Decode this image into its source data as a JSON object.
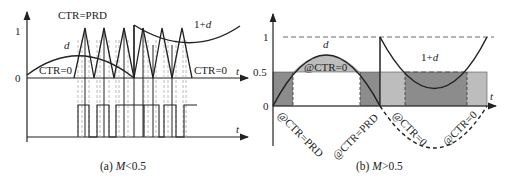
{
  "panel_a": {
    "caption_prefix": "(a) ",
    "caption_var": "M",
    "caption_suffix": "<0.5",
    "y_tick_1": "1",
    "y_tick_0": "0",
    "label_ctr_prd": "CTR=PRD",
    "label_ctr0_left": "CTR=0",
    "label_ctr0_right": "CTR=0",
    "label_d": "d",
    "label_1pd_num": "1+",
    "label_1pd_var": "d",
    "x_label_top": "t",
    "x_label_bottom": "t"
  },
  "panel_b": {
    "caption_prefix": "(b) ",
    "caption_var": "M",
    "caption_suffix": ">0.5",
    "y_tick_1": "1",
    "y_tick_05": "0.5",
    "y_tick_0": "0",
    "label_d": "d",
    "label_1pd_num": "1+",
    "label_1pd_var": "d",
    "label_at_ctr0_top": "@CTR=0",
    "rot_labels": [
      "@CTR=PRD",
      "@CTR=PRD",
      "@CTR=0",
      "@CTR=0"
    ],
    "x_label": "t"
  },
  "colors": {
    "line": "#222222",
    "dashed_guide": "#aaaaaa",
    "dark_fill": "#8c8c8c",
    "light_fill": "#bdbdbd"
  }
}
